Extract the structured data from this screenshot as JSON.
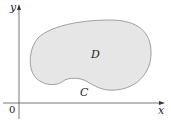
{
  "diagram": {
    "axes": {
      "x_label": "x",
      "y_label": "y",
      "origin_label": "0",
      "axis_color": "#555555"
    },
    "region": {
      "label": "D",
      "fill": "#e6e6e6",
      "stroke": "#8a8a8a"
    },
    "curve": {
      "label": "C"
    }
  }
}
